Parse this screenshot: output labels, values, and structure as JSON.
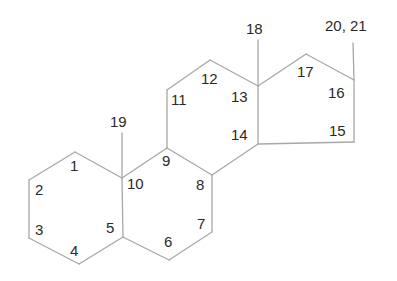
{
  "diagram": {
    "line_color": "#a8a8a8",
    "text_color": "#2a2a2a",
    "labels": [
      {
        "id": "c1",
        "text": "1",
        "x": 70,
        "y": 158
      },
      {
        "id": "c2",
        "text": "2",
        "x": 35,
        "y": 182
      },
      {
        "id": "c3",
        "text": "3",
        "x": 35,
        "y": 222
      },
      {
        "id": "c4",
        "text": "4",
        "x": 70,
        "y": 243
      },
      {
        "id": "c5",
        "text": "5",
        "x": 106,
        "y": 220
      },
      {
        "id": "c6",
        "text": "6",
        "x": 164,
        "y": 234
      },
      {
        "id": "c7",
        "text": "7",
        "x": 197,
        "y": 216
      },
      {
        "id": "c8",
        "text": "8",
        "x": 196,
        "y": 177
      },
      {
        "id": "c9",
        "text": "9",
        "x": 162,
        "y": 153
      },
      {
        "id": "c10",
        "text": "10",
        "x": 127,
        "y": 176
      },
      {
        "id": "c11",
        "text": "11",
        "x": 171,
        "y": 92
      },
      {
        "id": "c12",
        "text": "12",
        "x": 201,
        "y": 71
      },
      {
        "id": "c13",
        "text": "13",
        "x": 231,
        "y": 89
      },
      {
        "id": "c14",
        "text": "14",
        "x": 231,
        "y": 127
      },
      {
        "id": "c15",
        "text": "15",
        "x": 329,
        "y": 123
      },
      {
        "id": "c16",
        "text": "16",
        "x": 328,
        "y": 85
      },
      {
        "id": "c17",
        "text": "17",
        "x": 297,
        "y": 64
      },
      {
        "id": "c18",
        "text": "18",
        "x": 246,
        "y": 21
      },
      {
        "id": "c19",
        "text": "19",
        "x": 110,
        "y": 114
      },
      {
        "id": "c20_21",
        "text": "20, 21",
        "x": 325,
        "y": 18
      }
    ],
    "bonds": [
      [
        75,
        152,
        122,
        178
      ],
      [
        122,
        178,
        123,
        237
      ],
      [
        123,
        237,
        79,
        264
      ],
      [
        79,
        264,
        29,
        238
      ],
      [
        29,
        238,
        29,
        180
      ],
      [
        29,
        180,
        75,
        152
      ],
      [
        122,
        178,
        167,
        148
      ],
      [
        167,
        148,
        212,
        175
      ],
      [
        212,
        175,
        212,
        232
      ],
      [
        212,
        232,
        169,
        260
      ],
      [
        169,
        260,
        123,
        237
      ],
      [
        167,
        148,
        167,
        90
      ],
      [
        167,
        90,
        210,
        60
      ],
      [
        210,
        60,
        258,
        86
      ],
      [
        258,
        86,
        258,
        144
      ],
      [
        258,
        144,
        212,
        175
      ],
      [
        258,
        86,
        306,
        54
      ],
      [
        306,
        54,
        354,
        80
      ],
      [
        354,
        80,
        354,
        142
      ],
      [
        354,
        142,
        258,
        144
      ],
      [
        122,
        178,
        122,
        133
      ],
      [
        258,
        86,
        258,
        40
      ],
      [
        354,
        80,
        353,
        43
      ]
    ]
  }
}
